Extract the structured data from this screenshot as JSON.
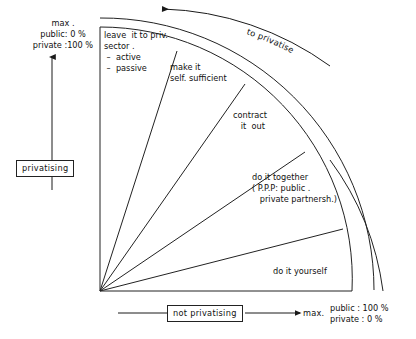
{
  "figure": {
    "background": "#ffffff",
    "line_color": "#222222",
    "text_color": "#111111"
  },
  "axes": {
    "vertical": {
      "box_label": "privatising",
      "top_corner": "max .\npublic: 0 %\nprivate :100 %",
      "arrow_direction": "up"
    },
    "horizontal": {
      "box_label": "not privatising",
      "max_label": "max.",
      "bottom_corner": "public : 100 %\nprivate : 0 %",
      "arrow_direction": "right"
    }
  },
  "arc_arrow": {
    "label": "to privatise",
    "letters": [
      "t",
      "o",
      " ",
      "p",
      "r",
      "i",
      "v",
      "a",
      "t",
      "i",
      "s",
      "e"
    ],
    "direction": "counter-clockwise"
  },
  "segments": [
    {
      "id": "leave-it-to-private-sector",
      "label": "leave  it to priv.\nsector .\n –  active\n –  passive",
      "lines": [
        "leave  it to priv.",
        "sector .",
        " –  active",
        " –  passive"
      ]
    },
    {
      "id": "make-it-self-sufficient",
      "label": "make it\nself. sufficient",
      "lines": [
        "make it",
        "self. sufficient"
      ]
    },
    {
      "id": "contract-it-out",
      "label": "contract\n   it  out",
      "lines": [
        "contract",
        "   it  out"
      ]
    },
    {
      "id": "do-it-together-ppp",
      "label": "do it together\n( P.P.P: public .\n   private partnersh.)",
      "lines": [
        "do it together",
        "( P.P.P: public .",
        "   private partnersh.)"
      ]
    },
    {
      "id": "do-it-yourself",
      "label": "do it yourself",
      "lines": [
        "do it yourself"
      ]
    }
  ]
}
